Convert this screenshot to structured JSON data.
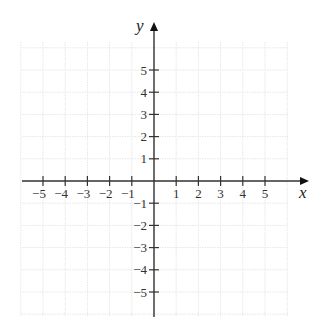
{
  "chart_data": {
    "type": "coordinate-plane",
    "title": "",
    "xlabel": "x",
    "ylabel": "y",
    "xlim": [
      -6,
      6
    ],
    "ylim": [
      -6,
      6
    ],
    "grid": true,
    "x_ticks": [
      -5,
      -4,
      -3,
      -2,
      -1,
      1,
      2,
      3,
      4,
      5
    ],
    "y_ticks": [
      -5,
      -4,
      -3,
      -2,
      -1,
      1,
      2,
      3,
      4,
      5
    ],
    "x_tick_labels": [
      "−5",
      "−4",
      "−3",
      "−2",
      "−1",
      "1",
      "2",
      "3",
      "4",
      "5"
    ],
    "y_tick_labels": [
      "−5",
      "−4",
      "−3",
      "−2",
      "−1",
      "1",
      "2",
      "3",
      "4",
      "5"
    ],
    "series": []
  },
  "colors": {
    "axis": "#333333",
    "grid": "#e6e6e6",
    "background": "#ffffff"
  }
}
